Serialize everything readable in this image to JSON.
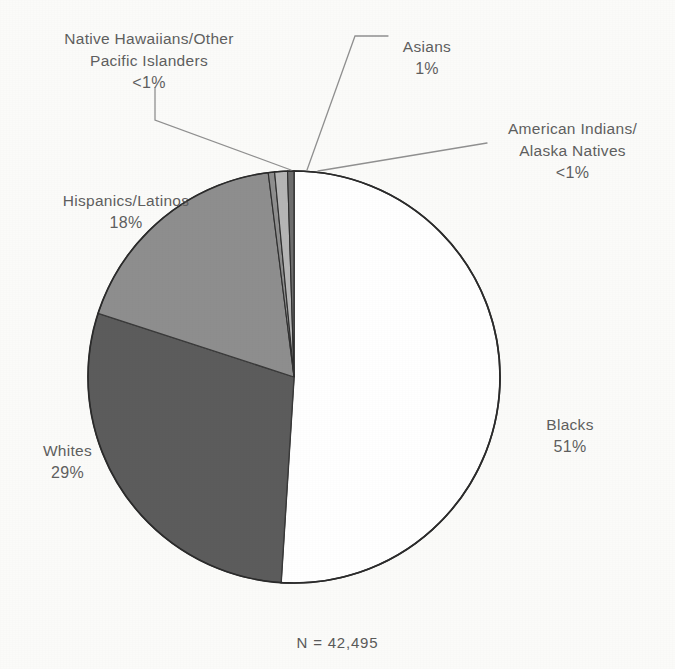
{
  "figure": {
    "caption": "N = 42,495",
    "background_color": "#fbfbf9",
    "outline_color": "#2b2b2b",
    "leader_line_color": "#8d8d8d"
  },
  "labels": {
    "native_hawaiian": {
      "name": "Native Hawaiians/Other\nPacific Islanders",
      "percent": "<1%"
    },
    "asian": {
      "name": "Asians",
      "percent": "1%"
    },
    "american_indian": {
      "name": "American Indians/\nAlaska Natives",
      "percent": "<1%"
    },
    "hispanic": {
      "name": "Hispanics/Latinos",
      "percent": "18%"
    },
    "white": {
      "name": "Whites",
      "percent": "29%"
    },
    "black": {
      "name": "Blacks",
      "percent": "51%"
    }
  },
  "chart_data": {
    "type": "pie",
    "title": "",
    "total_label": "N = 42,495",
    "total": 42495,
    "units": "percent",
    "legend": "labels placed outside slices with leader lines",
    "categories": [
      "Blacks",
      "Whites",
      "Hispanics/Latinos",
      "Native Hawaiians/Other Pacific Islanders",
      "Asians",
      "American Indians/Alaska Natives"
    ],
    "values": [
      51,
      29,
      18,
      0.5,
      1,
      0.5
    ],
    "value_labels": [
      "51%",
      "29%",
      "18%",
      "<1%",
      "1%",
      "<1%"
    ],
    "colors": [
      "#ffffff",
      "#5c5c5c",
      "#8e8e8e",
      "#8e8e8e",
      "#b5b5b5",
      "#6e6e6e"
    ],
    "slices": [
      {
        "label": "Blacks",
        "value": 51,
        "display": "51%",
        "color": "#ffffff",
        "start_deg": 0,
        "end_deg": 183.6
      },
      {
        "label": "Whites",
        "value": 29,
        "display": "29%",
        "color": "#5c5c5c",
        "start_deg": 183.6,
        "end_deg": 288.0
      },
      {
        "label": "Hispanics/Latinos",
        "value": 18,
        "display": "18%",
        "color": "#8e8e8e",
        "start_deg": 288.0,
        "end_deg": 352.8
      },
      {
        "label": "Native Hawaiians/Other Pacific Islanders",
        "value": 0.5,
        "display": "<1%",
        "color": "#8e8e8e",
        "start_deg": 352.8,
        "end_deg": 354.6
      },
      {
        "label": "Asians",
        "value": 1,
        "display": "1%",
        "color": "#b5b5b5",
        "start_deg": 354.6,
        "end_deg": 358.2
      },
      {
        "label": "American Indians/Alaska Natives",
        "value": 0.5,
        "display": "<1%",
        "color": "#6e6e6e",
        "start_deg": 358.2,
        "end_deg": 360
      }
    ],
    "geometry": {
      "center_x": 294,
      "center_y": 377,
      "radius": 206,
      "start_angle_deg": 0,
      "direction": "clockwise"
    }
  }
}
